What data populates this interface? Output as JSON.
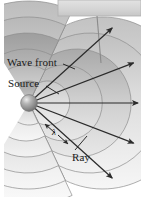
{
  "figure": {
    "type": "physics-diagram",
    "width": 141,
    "height": 197,
    "background_color": "#ffffff"
  },
  "labels": {
    "wave_front": "Wave front",
    "source": "Source",
    "ray": "Ray",
    "wavelength": "λ"
  },
  "colors": {
    "background": "#ffffff",
    "bar_fill": "#d6d6d6",
    "bar_stroke": "#b0b0b0",
    "arc_light": "#f3f3f3",
    "arc_mid": "#d9d9d9",
    "arc_dark": "#9e9e9e",
    "arc_outline": "#8c8c8c",
    "ray_stroke": "#2b2b2b",
    "source_light": "#e8e8e8",
    "source_mid": "#9a9a9a",
    "source_dark": "#6a6a6a",
    "text": "#1a1a1a",
    "leader_stroke": "#8a8a8a"
  },
  "geometry": {
    "source": {
      "cx": 29,
      "cy": 103,
      "r": 8
    },
    "wavefront_radii": [
      22,
      38,
      54,
      70,
      86,
      102
    ],
    "ray_angles_deg": [
      -42,
      -21,
      0,
      21,
      42
    ],
    "ray_length": 112,
    "arc_span_deg": {
      "start": -115,
      "end": 115
    }
  },
  "top_bar": {
    "x": 58,
    "y": 0,
    "width": 83,
    "height": 16,
    "leader_line": {
      "x1": 97,
      "y1": 16,
      "x2": 101,
      "y2": 62
    }
  },
  "annotations": {
    "wave_front_leader": {
      "x1": 62,
      "y1": 64,
      "x2": 74,
      "y2": 68
    },
    "source_leader": {
      "x1": 45,
      "y1": 86,
      "x2": 56,
      "y2": 92
    },
    "ray_leader": {
      "x1": 74,
      "y1": 150,
      "x2": 84,
      "y2": 138
    },
    "wavelength_arrows": {
      "x1": 44,
      "y1": 124,
      "x2": 66,
      "y2": 142
    }
  }
}
